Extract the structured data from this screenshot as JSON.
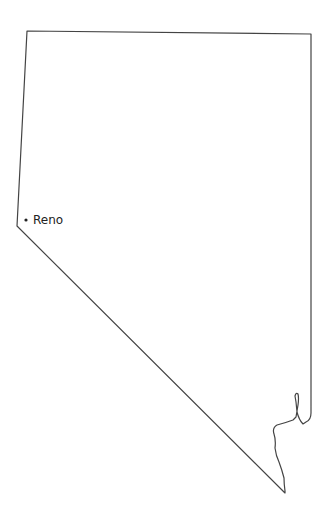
{
  "map": {
    "region": "Nevada",
    "outline_color": "#444444",
    "background": "#ffffff",
    "cities": [
      {
        "name": "Reno",
        "x": 25,
        "y": 220
      }
    ]
  }
}
